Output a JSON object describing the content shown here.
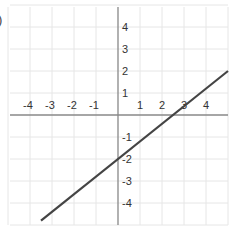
{
  "fragment": ")",
  "chart_data": {
    "type": "line",
    "title": "",
    "xlabel": "",
    "ylabel": "",
    "xlim": [
      -5,
      5
    ],
    "ylim": [
      -5,
      5
    ],
    "grid": true,
    "x_ticks": [
      -4,
      -3,
      -2,
      -1,
      1,
      2,
      3,
      4
    ],
    "y_ticks": [
      4,
      3,
      2,
      1,
      -1,
      -2,
      -3,
      -4
    ],
    "x_tick_labels": [
      "-4",
      "-3",
      "-2",
      "-1",
      "1",
      "2",
      "3",
      "4"
    ],
    "y_tick_labels": [
      "4",
      "3",
      "2",
      "1",
      "-1",
      "-2",
      "-3",
      "-4"
    ],
    "series": [
      {
        "name": "line",
        "equation": "y = 0.8x - 2",
        "slope": 0.8,
        "intercept": -2,
        "x": [
          -3.5,
          5
        ],
        "y": [
          -4.8,
          2
        ],
        "color": "#444444"
      }
    ]
  },
  "colors": {
    "grid": "#e6e6e6",
    "axis": "#888888",
    "line": "#444444"
  }
}
